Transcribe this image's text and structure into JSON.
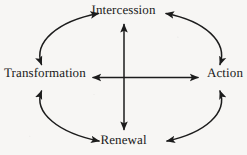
{
  "diagram": {
    "type": "cycle-diagram",
    "title": "",
    "stroke_color": "#1c1c1c",
    "background_color": "#f7f6f4",
    "text_color": "#1a1a1a",
    "nodes": [
      {
        "id": "intercession",
        "label": "Intercession",
        "position": "top"
      },
      {
        "id": "transformation",
        "label": "Transformation",
        "position": "left"
      },
      {
        "id": "action",
        "label": "Action",
        "position": "right"
      },
      {
        "id": "renewal",
        "label": "Renewal",
        "position": "bottom"
      }
    ],
    "connectors": [
      {
        "id": "arc-transformation-intercession",
        "from": "transformation",
        "to": "intercession",
        "shape": "arc",
        "arrowheads": "both"
      },
      {
        "id": "arc-intercession-action",
        "from": "intercession",
        "to": "action",
        "shape": "arc",
        "arrowheads": "both"
      },
      {
        "id": "arc-action-renewal",
        "from": "action",
        "to": "renewal",
        "shape": "arc",
        "arrowheads": "both"
      },
      {
        "id": "arc-renewal-transformation",
        "from": "renewal",
        "to": "transformation",
        "shape": "arc",
        "arrowheads": "both"
      },
      {
        "id": "axis-vertical",
        "from": "renewal",
        "to": "intercession",
        "shape": "straight",
        "arrowheads": "both"
      },
      {
        "id": "axis-horizontal",
        "from": "transformation",
        "to": "action",
        "shape": "straight",
        "arrowheads": "both"
      }
    ]
  }
}
